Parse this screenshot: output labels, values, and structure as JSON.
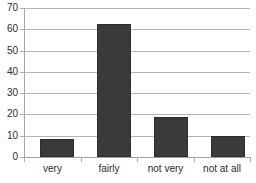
{
  "chart_data": {
    "type": "bar",
    "title": "",
    "subtitle": "",
    "xlabel": "",
    "ylabel": "",
    "categories": [
      "very",
      "fairly",
      "not very",
      "not at all"
    ],
    "values": [
      8.5,
      62.5,
      19,
      10
    ],
    "series": [
      {
        "name": "",
        "values": [
          8.5,
          62.5,
          19,
          10
        ]
      }
    ],
    "ylim": [
      0,
      70
    ],
    "ytick_labels": [
      "0",
      "10",
      "20",
      "30",
      "40",
      "50",
      "60",
      "70"
    ],
    "ytick_values": [
      0,
      10,
      20,
      30,
      40,
      50,
      60,
      70
    ],
    "grid": true,
    "grid_axis": "y",
    "legend": false,
    "legend_position": "none",
    "bar_color": "#3a3a3a",
    "grid_color": "#b2b2b2",
    "axis_color": "#a8a8a8",
    "text_color": "#2b2b2b",
    "background": "#ffffff"
  }
}
